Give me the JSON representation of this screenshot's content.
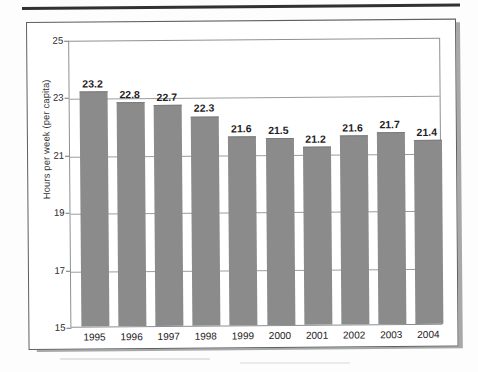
{
  "figure": {
    "frame_border_color": "#5d5f61",
    "shadow_color": "#a8a8a8",
    "top_rule_color": "#2f3133"
  },
  "chart_data": {
    "type": "bar",
    "title": "",
    "subtitle": "",
    "xlabel": "",
    "ylabel": "Hours per week (per capita)",
    "categories": [
      "1995",
      "1996",
      "1997",
      "1998",
      "1999",
      "2000",
      "2001",
      "2002",
      "2003",
      "2004"
    ],
    "values": [
      23.2,
      22.8,
      22.7,
      22.3,
      21.6,
      21.5,
      21.2,
      21.6,
      21.7,
      21.4
    ],
    "value_labels": [
      "23.2",
      "22.8",
      "22.7",
      "22.3",
      "21.6",
      "21.5",
      "21.2",
      "21.6",
      "21.7",
      "21.4"
    ],
    "ylim": [
      15,
      25
    ],
    "ytick_labels": [
      "15",
      "17",
      "19",
      "21",
      "23",
      "25"
    ],
    "ytick_values": [
      15,
      17,
      19,
      21,
      23,
      25
    ],
    "gridlines": [
      17,
      19,
      21,
      23,
      25
    ],
    "grid": true,
    "legend": null,
    "legend_position": "none",
    "bar_color": "#8b8b8b",
    "series": [
      {
        "name": "Hours per week (per capita)",
        "values": [
          23.2,
          22.8,
          22.7,
          22.3,
          21.6,
          21.5,
          21.2,
          21.6,
          21.7,
          21.4
        ]
      }
    ]
  }
}
